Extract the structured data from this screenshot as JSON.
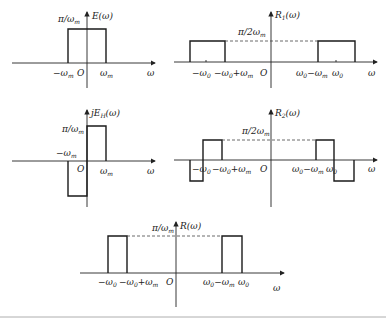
{
  "figure": {
    "panels": [
      {
        "id": "E",
        "title": "E(ω)",
        "amplitude_label": "π/ωm",
        "x_labels": [
          "−ωm",
          "O",
          "ωm",
          "ω"
        ],
        "description": "Rectangular pulse from −ωm to ωm with height π/ωm"
      },
      {
        "id": "R1",
        "title": "R1(ω)",
        "amplitude_label": "π/2ωm",
        "x_labels": [
          "−ω0",
          "−ω0+ωm",
          "O",
          "ω0−ωm",
          "ω0",
          "ω"
        ],
        "description": "Two rectangular bands of height π/2ωm centered at ±ω0"
      },
      {
        "id": "jEH",
        "title": "jEH(ω)",
        "amplitude_label": "π/ωm",
        "x_labels": [
          "−ωm",
          "O",
          "ωm",
          "ω"
        ],
        "description": "Positive pulse on (0, ωm), negative pulse on (−ωm, 0)"
      },
      {
        "id": "R2",
        "title": "R2(ω)",
        "amplitude_label": "π/2ωm",
        "x_labels": [
          "−ω0",
          "−ω0+ωm",
          "O",
          "ω0−ωm",
          "ω0",
          "ω"
        ],
        "description": "Antisymmetric bands around ±ω0"
      },
      {
        "id": "R",
        "title": "R(ω)",
        "amplitude_label": "π/ωm",
        "x_labels": [
          "−ω0",
          "−ω0+ωm",
          "O",
          "ω0−ωm",
          "ω0",
          "ω"
        ],
        "description": "Lower sidebands of height π/ωm: (−ω0, −ω0+ωm) and (ω0−ωm, ω0)"
      }
    ]
  },
  "text": {
    "E_title_main": "E(ω)",
    "E_amp": "π/ω",
    "m": "m",
    "neg_w": "−ω",
    "O": "O",
    "w": "ω",
    "w0": "0",
    "R1_main": "R",
    "R1_sub": "1",
    "R2_sub": "2",
    "paren_w": "(ω)",
    "half_amp": "π/2ω",
    "jE": "jE",
    "H": "H",
    "plus_w": "+ω",
    "minus_w": "−ω",
    "R_title": "R(ω)"
  }
}
